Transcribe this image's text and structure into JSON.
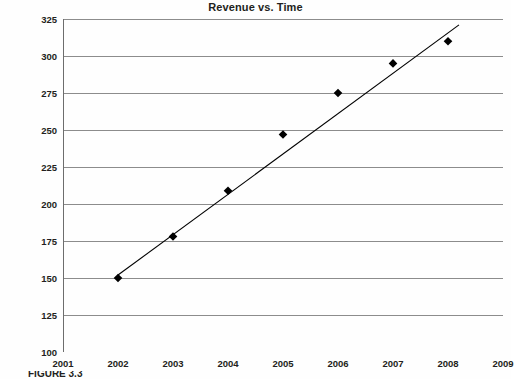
{
  "chart_data": {
    "type": "scatter",
    "title": "Revenue vs. Time",
    "xlabel": "",
    "ylabel": "",
    "x": [
      2002,
      2003,
      2004,
      2005,
      2006,
      2007,
      2008
    ],
    "values": [
      150,
      178,
      209,
      247,
      275,
      295,
      310
    ],
    "series": [
      {
        "name": "Revenue",
        "marker": "diamond",
        "color": "#000000",
        "points": [
          {
            "x": 2002,
            "y": 150
          },
          {
            "x": 2003,
            "y": 178
          },
          {
            "x": 2004,
            "y": 209
          },
          {
            "x": 2005,
            "y": 247
          },
          {
            "x": 2006,
            "y": 275
          },
          {
            "x": 2007,
            "y": 295
          },
          {
            "x": 2008,
            "y": 310
          }
        ]
      },
      {
        "name": "Trendline",
        "type": "line",
        "color": "#000000",
        "endpoints": [
          {
            "x": 2002.0,
            "y": 152
          },
          {
            "x": 2008.2,
            "y": 321
          }
        ]
      }
    ],
    "xlim": [
      2001,
      2009
    ],
    "ylim": [
      100,
      325
    ],
    "xticks": [
      "2001",
      "2002",
      "2003",
      "2004",
      "2005",
      "2006",
      "2007",
      "2008",
      "2009"
    ],
    "yticks": [
      "100",
      "125",
      "150",
      "175",
      "200",
      "225",
      "250",
      "275",
      "300",
      "325"
    ],
    "grid": "horizontal",
    "legend": "none",
    "gridline_color": "#8c8c8c",
    "axis_color": "#6d6d6d"
  },
  "caption": {
    "text": "FIGURE 3.3"
  }
}
